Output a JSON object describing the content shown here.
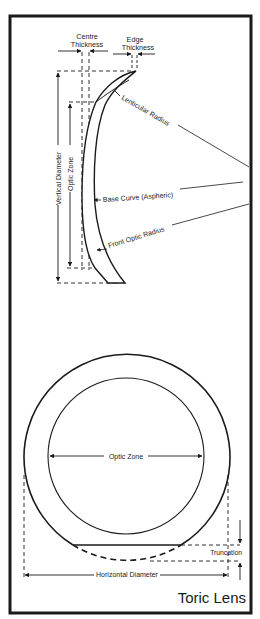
{
  "title": "Toric Lens",
  "side_view": {
    "labels": {
      "centre_thickness_line1": "Centre",
      "centre_thickness_line2": "Thickness",
      "edge_thickness_line1": "Edge",
      "edge_thickness_line2": "Thickness",
      "lenticular_radius": "Lenticular Radius",
      "base_curve": "Base Curve (Aspheric)",
      "front_optic_radius": "Front Optic Radius",
      "vertical_diameter": "Vertical Diameter",
      "optic_zone": "Optic Zone"
    }
  },
  "front_view": {
    "labels": {
      "optic_zone": "Optic Zone",
      "truncation": "Truncation",
      "horizontal_diameter": "Horizontal Diameter"
    }
  },
  "colors": {
    "ink": "#1a1a1a",
    "background": "#ffffff"
  }
}
